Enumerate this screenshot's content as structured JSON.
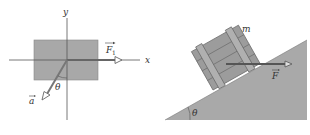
{
  "left_figure": {
    "x_axis_label": "x",
    "y_axis_label": "y",
    "force_label": "F",
    "force_subscript": "1",
    "accel_label": "a",
    "angle_label": "θ",
    "block_color": "#a8a8a8",
    "axis_color": "#555555"
  },
  "right_figure": {
    "mass_label": "m",
    "force_label": "F",
    "angle_label": "θ",
    "incline_color": "#a9a9a9",
    "crate_color": "#9c9c9c"
  }
}
